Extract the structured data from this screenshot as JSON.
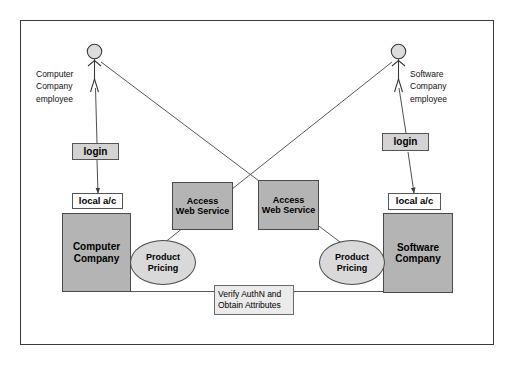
{
  "diagram": {
    "frame": {
      "border_color": "#3a3a3a",
      "background": "#ffffff"
    },
    "colors": {
      "node_fill": "#b4b4b4",
      "ellipse_fill": "#d9d9d9",
      "label_fill": "#d3d3d3",
      "note_fill": "#ebebeb",
      "line": "#4a4a4a",
      "text": "#000000"
    },
    "actors": [
      {
        "id": "computer-company-employee",
        "label": "Computer\nCompany\nemployee",
        "side": "left"
      },
      {
        "id": "software-company-employee",
        "label": "Software\nCompany\nemployee",
        "side": "right"
      }
    ],
    "login_labels": [
      {
        "id": "login-left",
        "text": "login"
      },
      {
        "id": "login-right",
        "text": "login"
      }
    ],
    "account_labels": [
      {
        "id": "local-ac-left",
        "text": "local a/c"
      },
      {
        "id": "local-ac-right",
        "text": "local a/c"
      }
    ],
    "systems": [
      {
        "id": "computer-company",
        "text": "Computer\nCompany"
      },
      {
        "id": "software-company",
        "text": "Software\nCompany"
      }
    ],
    "services": [
      {
        "id": "access-web-service-left",
        "text": "Access\nWeb Service"
      },
      {
        "id": "access-web-service-right",
        "text": "Access\nWeb Service"
      }
    ],
    "use_cases": [
      {
        "id": "product-pricing-left",
        "text": "Product\nPricing"
      },
      {
        "id": "product-pricing-right",
        "text": "Product\nPricing"
      }
    ],
    "note": {
      "id": "verify-authn-note",
      "line1": "Verify AuthN and",
      "line2": "Obtain Attributes"
    }
  }
}
